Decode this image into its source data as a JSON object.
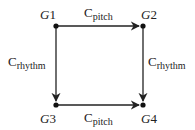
{
  "diagram": {
    "nodes": [
      {
        "id": "G1",
        "letter": "G",
        "num": "1"
      },
      {
        "id": "G2",
        "letter": "G",
        "num": "2"
      },
      {
        "id": "G3",
        "letter": "G",
        "num": "3"
      },
      {
        "id": "G4",
        "letter": "G",
        "num": "4"
      }
    ],
    "edges": [
      {
        "from": "G1",
        "to": "G2",
        "label_main": "C",
        "label_sub": "pitch"
      },
      {
        "from": "G3",
        "to": "G4",
        "label_main": "C",
        "label_sub": "pitch"
      },
      {
        "from": "G1",
        "to": "G3",
        "label_main": "C",
        "label_sub": "rhythm"
      },
      {
        "from": "G2",
        "to": "G4",
        "label_main": "C",
        "label_sub": "rhythm"
      }
    ],
    "colors": {
      "line": "#222222",
      "background": "#ffffff"
    }
  }
}
